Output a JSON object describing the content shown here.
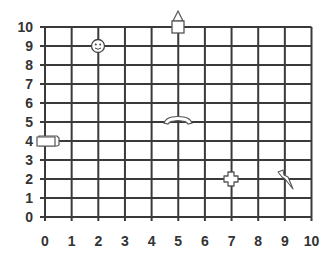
{
  "grid": {
    "x_min": 0,
    "x_max": 10,
    "y_min": 0,
    "y_max": 10,
    "x_ticks": [
      "0",
      "1",
      "2",
      "3",
      "4",
      "5",
      "6",
      "7",
      "8",
      "9",
      "10"
    ],
    "y_ticks": [
      "0",
      "1",
      "2",
      "3",
      "4",
      "5",
      "6",
      "7",
      "8",
      "9",
      "10"
    ],
    "line_color": "#3a3a3a",
    "label_color": "#333333"
  },
  "objects": [
    {
      "name": "smiley-face",
      "icon": "smiley-icon",
      "x": 2,
      "y": 9
    },
    {
      "name": "house-arrow",
      "icon": "house-icon",
      "x": 5,
      "y": 10
    },
    {
      "name": "phone-handset",
      "icon": "phone-icon",
      "x": 5,
      "y": 5
    },
    {
      "name": "rectangle-box",
      "icon": "box-icon",
      "x": 0,
      "y": 4
    },
    {
      "name": "cross-shape",
      "icon": "cross-icon",
      "x": 7,
      "y": 2
    },
    {
      "name": "lightning-bolt",
      "icon": "lightning-icon",
      "x": 9,
      "y": 2
    }
  ]
}
